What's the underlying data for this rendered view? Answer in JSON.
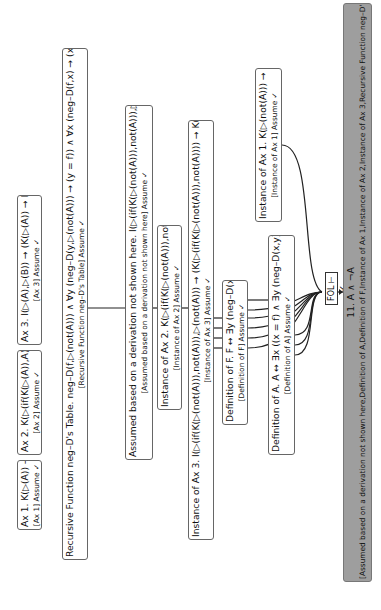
{
  "diagram": {
    "nodes": [
      {
        "id": "ax1",
        "main": "Ax 1. K(▷(A)) → A",
        "just": "[Ax 1] Assume ✓"
      },
      {
        "id": "ax2",
        "main": "Ax 2. K(▷(if(K(▷(A)),A)))",
        "just": "[Ax 2] Assume ✓"
      },
      {
        "id": "ax3",
        "main": "Ax 3. I(▷(A),▷(B)) → (K(▷(A)) → K(▷(B)))",
        "just": "[Ax 3] Assume ✓"
      },
      {
        "id": "recursive",
        "main": "Recursive Function neg–D's Table. neg–D(f,▷(not(A))) ∧ ∀y (neg–D(y,▷(not(A))) → (y = f)) ∧ ∀x (neg–D(f,x) → (x = ▷(not(A))))",
        "just": "[Recursive Function neg–D's Table] Assume ✓"
      },
      {
        "id": "assumed",
        "main": "Assumed based on a derivation not shown here. I(▷(if(K(▷(not(A))),not(A))),▷(not(A)))",
        "just": "[Assumed based on a derivation not shown here] Assume ✓"
      },
      {
        "id": "inst_ax2",
        "main": "Instance of Ax 2. K(▷(if(K(▷(not(A))),not(A))))",
        "just": "[Instance of Ax 2] Assume ✓"
      },
      {
        "id": "inst_ax3",
        "main": "Instance of Ax 3. I(▷(if(K(▷(not(A))),not(A))),▷(not(A))) → (K(▷(if(K(▷(not(A))),not(A)))) → K(▷(not(A))))",
        "just": "[Instance of Ax 3] Assume ✓"
      },
      {
        "id": "def_f",
        "main": "Definition of F. F ↔ ∃y (neg–D(x,y) ∧ K(y))",
        "just": "[Definition of F] Assume ✓"
      },
      {
        "id": "def_a",
        "main": "Definition of A. A ↔ ∃x ((x = f) ∧ ∃y (neg–D(x,y) ∧ K(y)))",
        "just": "[Definition of A] Assume ✓"
      },
      {
        "id": "inst_ax1",
        "main": "Instance of Ax 1. K(▷(not(A))) → ¬A",
        "just": "[Instance of Ax 1] Assume ✓"
      },
      {
        "id": "conclusion",
        "main": "11. A ∧ ¬A",
        "just": "[Assumed based on a derivation not shown here,Definition of A,Definition of F,Instance of Ax 1,Instance of Ax 2,Instance of Ax 3,Recursive Function neg–D's Table]"
      }
    ],
    "inference": {
      "label": "FOL ⊢ ✓"
    },
    "colors": {
      "box_border": "#666666",
      "conclusion_fill": "#9e9e9e",
      "line": "#222222"
    }
  }
}
